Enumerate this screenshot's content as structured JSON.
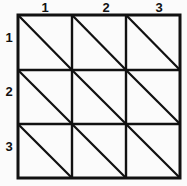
{
  "figure": {
    "background_color": "#fbfbfb",
    "line_color": "#111111",
    "grid": {
      "rows": 3,
      "columns": 3,
      "x_start": 18,
      "y_start": 15,
      "x_end": 180,
      "y_end": 178,
      "x_lines": [
        18,
        72,
        126,
        180
      ],
      "y_lines": [
        15,
        70,
        124,
        178
      ],
      "outer_line_width": 3,
      "inner_line_width": 2.4,
      "diagonal_line_width": 2.2,
      "diagonal_direction": "top-left-to-bottom-right"
    },
    "column_labels": [
      {
        "text": "1",
        "x": 38,
        "center_x": 45
      },
      {
        "text": "2",
        "x": 99,
        "center_x": 106
      },
      {
        "text": "3",
        "x": 152,
        "center_x": 159
      }
    ],
    "row_labels": [
      {
        "text": "1",
        "y": 31,
        "center_y": 38
      },
      {
        "text": "2",
        "y": 85,
        "center_y": 92
      },
      {
        "text": "3",
        "y": 140,
        "center_y": 147
      }
    ],
    "cells": [
      {
        "row": 1,
        "col": 1,
        "has_diagonal": true
      },
      {
        "row": 1,
        "col": 2,
        "has_diagonal": true
      },
      {
        "row": 1,
        "col": 3,
        "has_diagonal": true
      },
      {
        "row": 2,
        "col": 1,
        "has_diagonal": true
      },
      {
        "row": 2,
        "col": 2,
        "has_diagonal": true
      },
      {
        "row": 2,
        "col": 3,
        "has_diagonal": true
      },
      {
        "row": 3,
        "col": 1,
        "has_diagonal": true
      },
      {
        "row": 3,
        "col": 2,
        "has_diagonal": true
      },
      {
        "row": 3,
        "col": 3,
        "has_diagonal": true
      }
    ]
  }
}
